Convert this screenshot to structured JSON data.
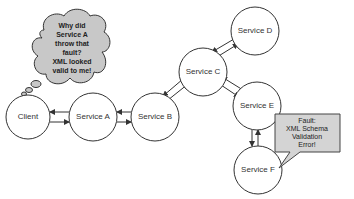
{
  "diagram": {
    "nodes": [
      {
        "id": "client",
        "label": "Client"
      },
      {
        "id": "service_a",
        "label": "Service A"
      },
      {
        "id": "service_b",
        "label": "Service B"
      },
      {
        "id": "service_c",
        "label": "Service C"
      },
      {
        "id": "service_d",
        "label": "Service D"
      },
      {
        "id": "service_e",
        "label": "Service E"
      },
      {
        "id": "service_f",
        "label": "Service F"
      }
    ],
    "edges": [
      {
        "from": "Client",
        "to": "Service A",
        "bidirectional": true
      },
      {
        "from": "Service A",
        "to": "Service B",
        "bidirectional": true
      },
      {
        "from": "Service B",
        "to": "Service C",
        "bidirectional": true
      },
      {
        "from": "Service C",
        "to": "Service D",
        "bidirectional": true
      },
      {
        "from": "Service C",
        "to": "Service E",
        "bidirectional": true
      },
      {
        "from": "Service E",
        "to": "Service F",
        "bidirectional": true
      }
    ],
    "thought_bubble": {
      "lines": [
        "Why did",
        "Service A",
        "throw that",
        "fault?",
        "XML looked",
        "valid to me!"
      ]
    },
    "fault_callout": {
      "lines": [
        "Fault:",
        "XML Schema",
        "Validation",
        "Error!"
      ]
    }
  }
}
